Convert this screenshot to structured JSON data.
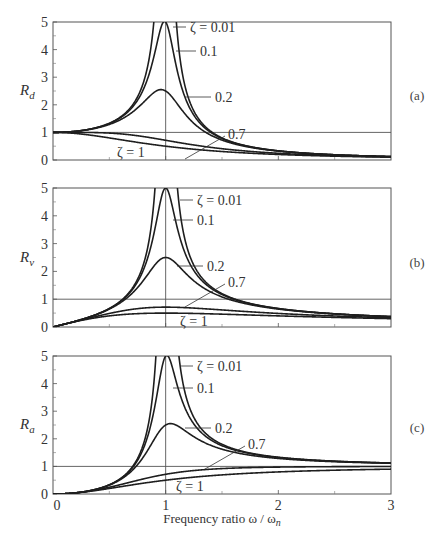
{
  "chart_data": [
    {
      "type": "line",
      "panel_tag": "(a)",
      "ylabel": "R_d",
      "ylabel_main": "R",
      "ylabel_sub": "d",
      "xlabel": "",
      "xlim": [
        0,
        3
      ],
      "ylim": [
        0,
        5
      ],
      "yticks": [
        "0",
        "1",
        "2",
        "3",
        "4",
        "5"
      ],
      "xticks": [],
      "reference_lines": {
        "horizontal_y": 1,
        "vertical_x": 1
      },
      "formula": "1/sqrt((1-r^2)^2+(2*zeta*r)^2)",
      "series": [
        {
          "name": "ζ = 0.01",
          "zeta": 0.01,
          "x": [
            0,
            0.5,
            0.8,
            0.9,
            1.0,
            1.1,
            1.2,
            1.5,
            2.0,
            2.5,
            3.0
          ],
          "values": [
            1.0,
            1.33,
            2.78,
            5.26,
            50.0,
            4.76,
            2.27,
            0.8,
            0.33,
            0.19,
            0.125
          ]
        },
        {
          "name": "0.1",
          "zeta": 0.1,
          "x": [
            0,
            0.5,
            0.8,
            0.9,
            1.0,
            1.1,
            1.2,
            1.5,
            2.0,
            2.5,
            3.0
          ],
          "values": [
            1.0,
            1.32,
            2.55,
            3.82,
            5.0,
            3.37,
            2.02,
            0.78,
            0.33,
            0.19,
            0.125
          ]
        },
        {
          "name": "0.2",
          "zeta": 0.2,
          "x": [
            0,
            0.5,
            0.8,
            0.9,
            1.0,
            1.1,
            1.2,
            1.5,
            2.0,
            2.5,
            3.0
          ],
          "values": [
            1.0,
            1.29,
            2.08,
            2.45,
            2.5,
            2.16,
            1.64,
            0.75,
            0.32,
            0.19,
            0.12
          ]
        },
        {
          "name": "0.7",
          "zeta": 0.7,
          "x": [
            0,
            0.5,
            0.8,
            0.9,
            1.0,
            1.1,
            1.2,
            1.5,
            2.0,
            2.5,
            3.0
          ],
          "values": [
            1.0,
            1.0,
            0.84,
            0.77,
            0.71,
            0.65,
            0.59,
            0.46,
            0.28,
            0.18,
            0.12
          ]
        },
        {
          "name": "ζ = 1",
          "zeta": 1.0,
          "x": [
            0,
            0.5,
            0.8,
            0.9,
            1.0,
            1.1,
            1.2,
            1.5,
            2.0,
            2.5,
            3.0
          ],
          "values": [
            1.0,
            0.8,
            0.61,
            0.55,
            0.5,
            0.45,
            0.41,
            0.31,
            0.2,
            0.14,
            0.1
          ]
        }
      ]
    },
    {
      "type": "line",
      "panel_tag": "(b)",
      "ylabel": "R_v",
      "ylabel_main": "R",
      "ylabel_sub": "v",
      "xlabel": "",
      "xlim": [
        0,
        3
      ],
      "ylim": [
        0,
        5
      ],
      "yticks": [
        "0",
        "1",
        "2",
        "3",
        "4",
        "5"
      ],
      "xticks": [],
      "reference_lines": {
        "horizontal_y": 1,
        "vertical_x": 1
      },
      "formula": "r/sqrt((1-r^2)^2+(2*zeta*r)^2)",
      "series": [
        {
          "name": "ζ = 0.01",
          "zeta": 0.01,
          "x": [
            0,
            0.5,
            0.8,
            0.9,
            1.0,
            1.1,
            1.2,
            1.5,
            2.0,
            2.5,
            3.0
          ],
          "values": [
            0,
            0.67,
            2.22,
            4.73,
            50.0,
            5.24,
            2.73,
            1.2,
            0.67,
            0.48,
            0.375
          ]
        },
        {
          "name": "0.1",
          "zeta": 0.1,
          "x": [
            0,
            0.5,
            0.8,
            0.9,
            1.0,
            1.1,
            1.2,
            1.5,
            2.0,
            2.5,
            3.0
          ],
          "values": [
            0,
            0.66,
            2.04,
            3.44,
            5.0,
            3.71,
            2.42,
            1.17,
            0.66,
            0.47,
            0.37
          ]
        },
        {
          "name": "0.2",
          "zeta": 0.2,
          "x": [
            0,
            0.5,
            0.8,
            0.9,
            1.0,
            1.1,
            1.2,
            1.5,
            2.0,
            2.5,
            3.0
          ],
          "values": [
            0,
            0.65,
            1.66,
            2.21,
            2.5,
            2.38,
            1.97,
            1.12,
            0.64,
            0.47,
            0.37
          ]
        },
        {
          "name": "0.7",
          "zeta": 0.7,
          "x": [
            0,
            0.5,
            0.8,
            0.9,
            1.0,
            1.1,
            1.2,
            1.5,
            2.0,
            2.5,
            3.0
          ],
          "values": [
            0,
            0.5,
            0.67,
            0.69,
            0.71,
            0.71,
            0.71,
            0.69,
            0.56,
            0.46,
            0.36
          ]
        },
        {
          "name": "ζ = 1",
          "zeta": 1.0,
          "x": [
            0,
            0.5,
            0.8,
            0.9,
            1.0,
            1.1,
            1.2,
            1.5,
            2.0,
            2.5,
            3.0
          ],
          "values": [
            0,
            0.4,
            0.49,
            0.5,
            0.5,
            0.5,
            0.49,
            0.46,
            0.4,
            0.34,
            0.3
          ]
        }
      ]
    },
    {
      "type": "line",
      "panel_tag": "(c)",
      "ylabel": "R_a",
      "ylabel_main": "R",
      "ylabel_sub": "a",
      "xlabel": "Frequency ratio ω / ωn",
      "xlim": [
        0,
        3
      ],
      "ylim": [
        0,
        5
      ],
      "yticks": [
        "0",
        "1",
        "2",
        "3",
        "4",
        "5"
      ],
      "xticks": [
        "0",
        "1",
        "2",
        "3"
      ],
      "reference_lines": {
        "horizontal_y": 1,
        "vertical_x": 1
      },
      "formula": "r^2/sqrt((1-r^2)^2+(2*zeta*r)^2)",
      "series": [
        {
          "name": "ζ = 0.01",
          "zeta": 0.01,
          "x": [
            0,
            0.5,
            0.8,
            0.9,
            1.0,
            1.1,
            1.2,
            1.5,
            2.0,
            2.5,
            3.0
          ],
          "values": [
            0,
            0.33,
            1.78,
            4.26,
            50.0,
            5.76,
            3.27,
            1.8,
            1.33,
            1.19,
            1.125
          ]
        },
        {
          "name": "0.1",
          "zeta": 0.1,
          "x": [
            0,
            0.5,
            0.8,
            0.9,
            1.0,
            1.1,
            1.2,
            1.5,
            2.0,
            2.5,
            3.0
          ],
          "values": [
            0,
            0.33,
            1.63,
            3.1,
            5.0,
            4.08,
            2.91,
            1.76,
            1.32,
            1.18,
            1.12
          ]
        },
        {
          "name": "0.2",
          "zeta": 0.2,
          "x": [
            0,
            0.5,
            0.8,
            0.9,
            1.0,
            1.1,
            1.2,
            1.5,
            2.0,
            2.5,
            3.0
          ],
          "values": [
            0,
            0.32,
            1.33,
            1.99,
            2.5,
            2.62,
            2.37,
            1.68,
            1.29,
            1.17,
            1.11
          ]
        },
        {
          "name": "0.7",
          "zeta": 0.7,
          "x": [
            0,
            0.5,
            0.8,
            0.9,
            1.0,
            1.1,
            1.2,
            1.5,
            2.0,
            2.5,
            3.0
          ],
          "values": [
            0,
            0.25,
            0.54,
            0.62,
            0.71,
            0.78,
            0.85,
            1.03,
            1.11,
            1.1,
            1.08
          ]
        },
        {
          "name": "ζ = 1",
          "zeta": 1.0,
          "x": [
            0,
            0.5,
            0.8,
            0.9,
            1.0,
            1.1,
            1.2,
            1.5,
            2.0,
            2.5,
            3.0
          ],
          "values": [
            0,
            0.2,
            0.39,
            0.45,
            0.5,
            0.55,
            0.59,
            0.69,
            0.8,
            0.86,
            0.9
          ]
        }
      ]
    }
  ],
  "labels": {
    "zeta_001": "ζ = 0.01",
    "zeta_01": "0.1",
    "zeta_02": "0.2",
    "zeta_07": "0.7",
    "zeta_1": "ζ = 1",
    "xlabel_main": "Frequency ratio ω / ω",
    "xlabel_sub": "n"
  }
}
